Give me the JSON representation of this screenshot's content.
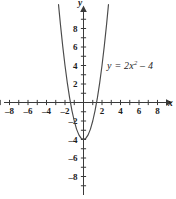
{
  "chart_data": {
    "type": "line",
    "title": "",
    "subtitle": "",
    "xlabel": "x",
    "ylabel": "y",
    "xlim": [
      -9.0,
      9.2
    ],
    "ylim": [
      -9.6,
      10.5
    ],
    "grid": false,
    "legend_position": "none",
    "x_ticks": [
      -8,
      -6,
      -4,
      -2,
      2,
      4,
      6,
      8
    ],
    "x_tick_labels": [
      "-8",
      "-6",
      "-4",
      "-2",
      "2",
      "4",
      "6",
      "8"
    ],
    "y_ticks": [
      -8,
      -6,
      -4,
      -2,
      2,
      4,
      6,
      8
    ],
    "y_tick_labels": [
      "-8",
      "-6",
      "-4",
      "-2",
      "2",
      "4",
      "6",
      "8"
    ],
    "x_minor_ticks": [
      -9,
      -7,
      -5,
      -3,
      -1,
      1,
      3,
      5,
      7,
      9
    ],
    "y_minor_ticks": [
      -9,
      -7,
      -5,
      -3,
      -1,
      1,
      3,
      5,
      7,
      9
    ],
    "annotations": [
      {
        "name": "equation-label",
        "text_plain": "y = 2x^2 - 4",
        "lead": "y = 2x",
        "exponent": "2",
        "tail": " – 4",
        "x": 3.2,
        "y": 4.0
      }
    ],
    "series": [
      {
        "name": "y = 2x^2 - 4",
        "equation": "y = 2x^2 - 4",
        "coefficient_a": 2,
        "coefficient_b": 0,
        "coefficient_c": -4,
        "vertex": [
          0,
          -4
        ],
        "roots": [
          -1.414,
          1.414
        ],
        "y_intercept": -4,
        "x": [
          -2.7,
          -2.5,
          -2.25,
          -2.0,
          -1.75,
          -1.5,
          -1.25,
          -1.0,
          -0.75,
          -0.5,
          -0.25,
          0,
          0.25,
          0.5,
          0.75,
          1.0,
          1.25,
          1.5,
          1.75,
          2.0,
          2.25,
          2.5,
          2.7
        ],
        "values": [
          10.58,
          8.5,
          6.125,
          4.0,
          2.125,
          0.5,
          -0.875,
          -2.0,
          -2.875,
          -3.5,
          -3.875,
          -4.0,
          -3.875,
          -3.5,
          -2.875,
          -2.0,
          -0.875,
          0.5,
          2.125,
          4.0,
          6.125,
          8.5,
          10.58
        ]
      }
    ]
  },
  "axes": {
    "x_axis_name": "x",
    "y_axis_name": "y"
  }
}
